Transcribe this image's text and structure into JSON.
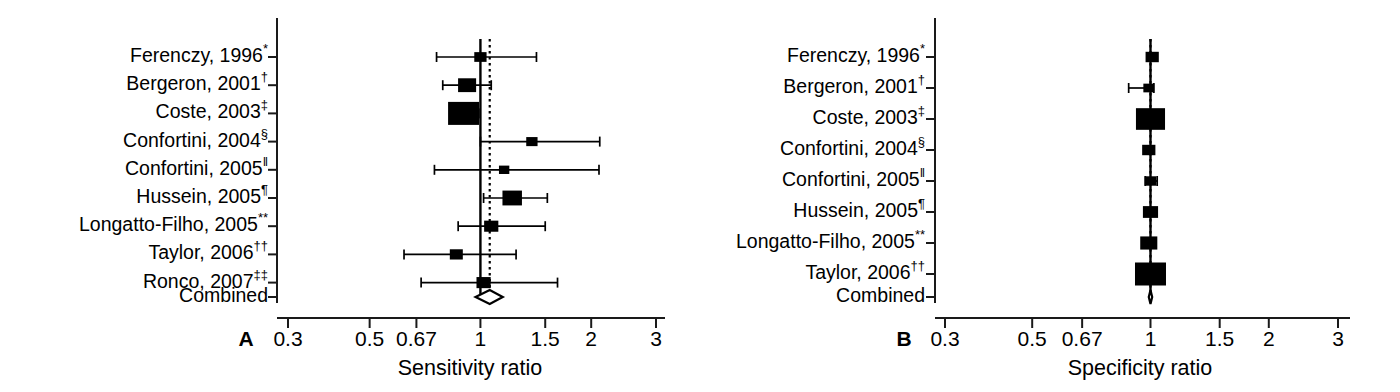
{
  "figure": {
    "type": "forest-plot-pair",
    "background": "#ffffff",
    "line_color": "#000000"
  },
  "chart_data": [
    {
      "type": "forest",
      "panel": "A",
      "panel_letter": "A",
      "xlabel": "Sensitivity ratio",
      "ylabel": "",
      "title": "",
      "scale": "log",
      "xlim": [
        0.3,
        3
      ],
      "grid": false,
      "legend": "none",
      "null_value": 1,
      "pooled_reference_line": 1.06,
      "ticks": [
        {
          "value": 0.3,
          "label": "0.3"
        },
        {
          "value": 0.5,
          "label": "0.5"
        },
        {
          "value": 0.67,
          "label": "0.67"
        },
        {
          "value": 1,
          "label": "1"
        },
        {
          "value": 1.5,
          "label": "1.5"
        },
        {
          "value": 2,
          "label": "2"
        },
        {
          "value": 3,
          "label": "3"
        }
      ],
      "rows": [
        {
          "label": "Ferenczy, 1996",
          "marker": "*",
          "estimate": 1.0,
          "ci_low": 0.76,
          "ci_high": 1.42,
          "weight": 0.22
        },
        {
          "label": "Bergeron, 2001",
          "marker": "†",
          "estimate": 0.92,
          "ci_low": 0.79,
          "ci_high": 1.07,
          "weight": 0.46
        },
        {
          "label": "Coste, 2003",
          "marker": "‡",
          "estimate": 0.9,
          "ci_low": 0.83,
          "ci_high": 0.99,
          "weight": 1.0
        },
        {
          "label": "Confortini, 2004",
          "marker": "§",
          "estimate": 1.38,
          "ci_low": 1.0,
          "ci_high": 2.11,
          "weight": 0.18
        },
        {
          "label": "Confortini, 2005",
          "marker": "‖",
          "estimate": 1.16,
          "ci_low": 0.75,
          "ci_high": 2.1,
          "weight": 0.14
        },
        {
          "label": "Hussein, 2005",
          "marker": "¶",
          "estimate": 1.22,
          "ci_low": 1.02,
          "ci_high": 1.52,
          "weight": 0.52
        },
        {
          "label": "Longatto-Filho, 2005",
          "marker": "**",
          "estimate": 1.07,
          "ci_low": 0.87,
          "ci_high": 1.5,
          "weight": 0.3
        },
        {
          "label": "Taylor, 2006",
          "marker": "††",
          "estimate": 0.86,
          "ci_low": 0.62,
          "ci_high": 1.25,
          "weight": 0.25
        },
        {
          "label": "Ronco, 2007",
          "marker": "‡‡",
          "estimate": 1.02,
          "ci_low": 0.69,
          "ci_high": 1.62,
          "weight": 0.3
        }
      ],
      "summary": {
        "label": "Combined",
        "estimate": 1.06,
        "ci_low": 0.97,
        "ci_high": 1.15,
        "shape": "diamond-open"
      }
    },
    {
      "type": "forest",
      "panel": "B",
      "panel_letter": "B",
      "xlabel": "Specificity ratio",
      "ylabel": "",
      "title": "",
      "scale": "log",
      "xlim": [
        0.3,
        3
      ],
      "grid": false,
      "legend": "none",
      "null_value": 1,
      "pooled_reference_line": 1.0,
      "ticks": [
        {
          "value": 0.3,
          "label": "0.3"
        },
        {
          "value": 0.5,
          "label": "0.5"
        },
        {
          "value": 0.67,
          "label": "0.67"
        },
        {
          "value": 1,
          "label": "1"
        },
        {
          "value": 1.5,
          "label": "1.5"
        },
        {
          "value": 2,
          "label": "2"
        },
        {
          "value": 3,
          "label": "3"
        }
      ],
      "rows": [
        {
          "label": "Ferenczy, 1996",
          "marker": "*",
          "estimate": 1.01,
          "ci_low": 0.99,
          "ci_high": 1.04,
          "weight": 0.26
        },
        {
          "label": "Bergeron, 2001",
          "marker": "†",
          "estimate": 0.99,
          "ci_low": 0.88,
          "ci_high": 1.02,
          "weight": 0.16
        },
        {
          "label": "Coste, 2003",
          "marker": "‡",
          "estimate": 1.0,
          "ci_low": 0.98,
          "ci_high": 1.03,
          "weight": 0.92
        },
        {
          "label": "Confortini, 2004",
          "marker": "§",
          "estimate": 0.99,
          "ci_low": 0.97,
          "ci_high": 1.02,
          "weight": 0.26
        },
        {
          "label": "Confortini, 2005",
          "marker": "‖",
          "estimate": 1.0,
          "ci_low": 0.97,
          "ci_high": 1.04,
          "weight": 0.2
        },
        {
          "label": "Hussein, 2005",
          "marker": "¶",
          "estimate": 1.0,
          "ci_low": 0.98,
          "ci_high": 1.02,
          "weight": 0.34
        },
        {
          "label": "Longatto-Filho, 2005",
          "marker": "**",
          "estimate": 0.99,
          "ci_low": 0.97,
          "ci_high": 1.0,
          "weight": 0.42
        },
        {
          "label": "Taylor, 2006",
          "marker": "††",
          "estimate": 1.0,
          "ci_low": 0.98,
          "ci_high": 1.02,
          "weight": 1.0
        }
      ],
      "summary": {
        "label": "Combined",
        "estimate": 1.0,
        "ci_low": 0.99,
        "ci_high": 1.01,
        "shape": "diamond-open"
      }
    }
  ]
}
